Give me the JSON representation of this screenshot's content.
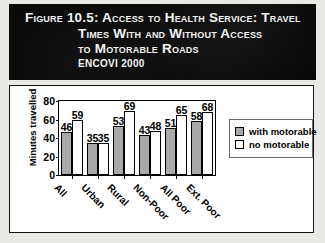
{
  "figure": {
    "title_lines": [
      "Figure 10.5:  Access to Health Service: Travel",
      "Times With and Without Access",
      "to Motorable Roads"
    ],
    "source": "ENCOVI 2000"
  },
  "chart_data": {
    "type": "bar",
    "title": "Access to Health Service: Travel Times With and Without Access to Motorable Roads",
    "subtitle": "ENCOVI 2000",
    "categories": [
      "All",
      "Urban",
      "Rural",
      "Non-Poor",
      "All Poor",
      "Ext. Poor"
    ],
    "series": [
      {
        "name": "with motorable",
        "values": [
          46,
          35,
          53,
          43,
          51,
          58
        ],
        "color": "#a9a9a9"
      },
      {
        "name": "no motorable",
        "values": [
          59,
          35,
          69,
          48,
          65,
          68
        ],
        "color": "#ffffff"
      }
    ],
    "xlabel": "",
    "ylabel": "Minutes travelled",
    "ylim": [
      0,
      80
    ],
    "yticks": [
      0,
      20,
      40,
      60,
      80
    ],
    "grid": false,
    "legend_position": "right",
    "data_labels": true
  }
}
